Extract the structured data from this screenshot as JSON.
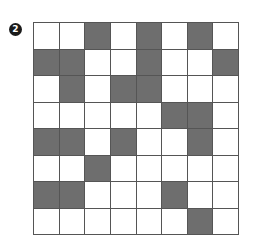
{
  "puzzle": {
    "number_label": "2",
    "rows": 8,
    "cols": 8,
    "fill_color": "#6e6e6e",
    "empty_color": "#ffffff",
    "grid": [
      [
        0,
        0,
        1,
        0,
        1,
        0,
        1,
        0
      ],
      [
        1,
        1,
        0,
        0,
        1,
        0,
        0,
        1
      ],
      [
        0,
        1,
        0,
        1,
        1,
        0,
        0,
        0
      ],
      [
        0,
        0,
        0,
        0,
        0,
        1,
        1,
        0
      ],
      [
        1,
        1,
        0,
        1,
        0,
        0,
        1,
        0
      ],
      [
        0,
        0,
        1,
        0,
        0,
        0,
        0,
        0
      ],
      [
        1,
        1,
        0,
        0,
        0,
        1,
        0,
        0
      ],
      [
        0,
        0,
        0,
        0,
        0,
        0,
        1,
        0
      ]
    ]
  }
}
